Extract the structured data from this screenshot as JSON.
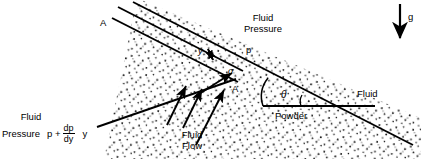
{
  "figure": {
    "background_color": "#ffffff",
    "ink_color": "#000000",
    "labels": {
      "top_left_plane": "A",
      "mid_plane": "A",
      "slab_thickness": "y",
      "normal_stress": "σ",
      "fluid_pressure_top_line1": "Fluid",
      "fluid_pressure_top_line2": "Pressure",
      "fluid_pressure_top_value": "p",
      "fluid_pressure_bottom_line1": "Fluid",
      "fluid_pressure_bottom_line2": "Pressure",
      "fluid_pressure_bottom_value_p": "p +",
      "fluid_pressure_bottom_numerator": "dp",
      "fluid_pressure_bottom_denominator": "dy",
      "fluid_pressure_bottom_y": "y",
      "fluid_flow_line1": "Fluid",
      "fluid_flow_line2": "Flow",
      "angle_theta": "θ",
      "powder": "Powder",
      "fluid_right": "Fluid",
      "gravity": "g"
    },
    "geometry": {
      "free_surface_angle_deg": 22,
      "slab_thickness_px": 13,
      "gravity_direction": "down"
    },
    "icons": {
      "gravity_arrow": "down-arrow-icon",
      "flow_arrows": "up-right-arrow-icon",
      "thickness_arrow": "double-headed-arrow-icon",
      "stress_arrow": "up-right-arrow-icon"
    }
  }
}
